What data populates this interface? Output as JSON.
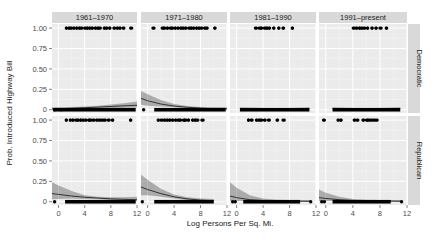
{
  "chart_data": {
    "type": "scatter",
    "subtype": "faceted logistic regression with binary points and confidence band",
    "xlabel": "Log Persons Per Sq. Mi.",
    "ylabel": "Prob. Introduced Highway Bill",
    "xlim": [
      -1,
      12
    ],
    "ylim": [
      0,
      1
    ],
    "x_ticks": [
      0,
      4,
      8,
      12
    ],
    "y_ticks": [
      0,
      0.25,
      0.5,
      0.75,
      1.0
    ],
    "y_tick_labels": [
      "0",
      "0.25",
      "0.50",
      "0.75",
      "1.00"
    ],
    "grid": true,
    "legend": "none",
    "facet_cols": [
      "1961–1970",
      "1971–1980",
      "1981–1990",
      "1991–present"
    ],
    "facet_rows": [
      "Democratic",
      "Republican"
    ],
    "panels": [
      {
        "row": "Democratic",
        "col": "1961–1970",
        "points_y1_x": [
          1.2,
          1.6,
          2.0,
          2.4,
          2.8,
          3.2,
          3.6,
          4.0,
          4.4,
          4.8,
          5.2,
          5.6,
          6.0,
          6.4,
          7.0,
          7.4,
          7.8,
          8.6,
          9.0,
          9.4,
          10.0,
          11.2
        ],
        "points_y0_range": [
          -0.8,
          11.8
        ],
        "points_y0_isolated": [
          -0.6,
          0.4
        ],
        "fit_x": [
          -1,
          0,
          2,
          4,
          6,
          8,
          10,
          12
        ],
        "fit_y": [
          0.01,
          0.012,
          0.018,
          0.025,
          0.032,
          0.04,
          0.048,
          0.055
        ],
        "ci_low": [
          0.0,
          0.0,
          0.005,
          0.012,
          0.018,
          0.022,
          0.025,
          0.028
        ],
        "ci_high": [
          0.03,
          0.03,
          0.035,
          0.04,
          0.05,
          0.065,
          0.08,
          0.1
        ]
      },
      {
        "row": "Democratic",
        "col": "1971–1980",
        "points_y1_x": [
          0.8,
          2.2,
          2.6,
          3.0,
          3.4,
          3.8,
          4.2,
          4.6,
          5.0,
          5.4,
          5.8,
          6.2,
          6.6,
          7.0,
          7.4,
          7.8,
          8.2,
          8.6,
          9.0,
          10.2
        ],
        "points_y0_range": [
          1.0,
          11.8
        ],
        "points_y0_isolated": [
          -0.6
        ],
        "fit_x": [
          -1,
          0,
          2,
          4,
          6,
          8,
          10,
          12
        ],
        "fit_y": [
          0.14,
          0.11,
          0.07,
          0.045,
          0.03,
          0.02,
          0.013,
          0.01
        ],
        "ci_low": [
          0.06,
          0.05,
          0.04,
          0.03,
          0.02,
          0.01,
          0.005,
          0.0
        ],
        "ci_high": [
          0.23,
          0.19,
          0.12,
          0.07,
          0.045,
          0.035,
          0.03,
          0.03
        ]
      },
      {
        "row": "Democratic",
        "col": "1981–1990",
        "points_y1_x": [
          3.0,
          3.4,
          3.8,
          4.2,
          4.6,
          5.0,
          5.6,
          6.4,
          7.0,
          8.4
        ],
        "points_y0_range": [
          0.5,
          11.0
        ],
        "points_y0_isolated": [],
        "fit_x": [
          0.5,
          4,
          8,
          11
        ],
        "fit_y": [
          0.012,
          0.012,
          0.012,
          0.012
        ],
        "ci_low": [
          0.0,
          0.005,
          0.005,
          0.0
        ],
        "ci_high": [
          0.03,
          0.02,
          0.02,
          0.03
        ]
      },
      {
        "row": "Democratic",
        "col": "1991–present",
        "points_y1_x": [
          4.2,
          4.6,
          5.0,
          5.4,
          5.8,
          6.2,
          6.8,
          7.4,
          8.0,
          9.0
        ],
        "points_y0_range": [
          1.0,
          11.0
        ],
        "points_y0_isolated": [],
        "fit_x": [
          1,
          4,
          8,
          11
        ],
        "fit_y": [
          0.014,
          0.014,
          0.014,
          0.014
        ],
        "ci_low": [
          0.0,
          0.006,
          0.006,
          0.0
        ],
        "ci_high": [
          0.03,
          0.022,
          0.022,
          0.03
        ]
      },
      {
        "row": "Republican",
        "col": "1961–1970",
        "points_y1_x": [
          1.2,
          1.8,
          2.2,
          2.6,
          3.0,
          3.4,
          3.8,
          4.2,
          4.6,
          5.0,
          5.4,
          5.8,
          6.2,
          6.6,
          7.0,
          7.6,
          8.2,
          11.0
        ],
        "points_y0_range": [
          1.0,
          11.8
        ],
        "points_y0_isolated": [
          -0.6
        ],
        "fit_x": [
          -1,
          0,
          2,
          4,
          6,
          8,
          10,
          12
        ],
        "fit_y": [
          0.1,
          0.09,
          0.07,
          0.055,
          0.045,
          0.035,
          0.03,
          0.025
        ],
        "ci_low": [
          0.03,
          0.035,
          0.04,
          0.035,
          0.03,
          0.02,
          0.01,
          0.005
        ],
        "ci_high": [
          0.24,
          0.2,
          0.13,
          0.08,
          0.06,
          0.055,
          0.055,
          0.06
        ]
      },
      {
        "row": "Republican",
        "col": "1971–1980",
        "points_y1_x": [
          1.6,
          2.2,
          2.6,
          3.0,
          3.4,
          3.8,
          4.2,
          4.6,
          5.0,
          5.4,
          5.8,
          6.2,
          6.8,
          7.2,
          7.6,
          8.2
        ],
        "points_y0_range": [
          1.0,
          10.0
        ],
        "points_y0_isolated": [
          -0.8
        ],
        "fit_x": [
          -1,
          0,
          2,
          4,
          6,
          8,
          10
        ],
        "fit_y": [
          0.18,
          0.15,
          0.1,
          0.06,
          0.035,
          0.02,
          0.012
        ],
        "ci_low": [
          0.08,
          0.08,
          0.06,
          0.04,
          0.02,
          0.008,
          0.0
        ],
        "ci_high": [
          0.33,
          0.27,
          0.16,
          0.09,
          0.055,
          0.04,
          0.035
        ]
      },
      {
        "row": "Republican",
        "col": "1981–1990",
        "points_y1_x": [
          1.8,
          2.2,
          3.0,
          3.4,
          3.8,
          4.2,
          4.8,
          6.2,
          7.2
        ],
        "points_y0_range": [
          1.0,
          9.6
        ],
        "points_y0_isolated": [
          -0.6,
          -0.2,
          11.2
        ],
        "fit_x": [
          -1,
          0,
          2,
          4,
          6,
          8,
          10,
          11.2
        ],
        "fit_y": [
          0.07,
          0.05,
          0.025,
          0.015,
          0.01,
          0.008,
          0.006,
          0.005
        ],
        "ci_low": [
          0.01,
          0.01,
          0.005,
          0.003,
          0.002,
          0.0,
          0.0,
          0.0
        ],
        "ci_high": [
          0.24,
          0.17,
          0.08,
          0.04,
          0.025,
          0.02,
          0.02,
          0.02
        ]
      },
      {
        "row": "Republican",
        "col": "1991–present",
        "points_y1_x": [
          -0.2,
          1.8,
          2.2,
          4.2,
          4.6,
          5.6,
          6.0,
          6.4,
          6.8,
          7.2,
          7.6
        ],
        "points_y0_range": [
          1.0,
          9.6
        ],
        "points_y0_isolated": [
          -0.6,
          -0.2,
          11.2
        ],
        "fit_x": [
          -1,
          0,
          2,
          4,
          6,
          8,
          10,
          11.2
        ],
        "fit_y": [
          0.05,
          0.04,
          0.025,
          0.016,
          0.012,
          0.009,
          0.007,
          0.006
        ],
        "ci_low": [
          0.01,
          0.01,
          0.008,
          0.005,
          0.003,
          0.0,
          0.0,
          0.0
        ],
        "ci_high": [
          0.15,
          0.11,
          0.06,
          0.035,
          0.025,
          0.02,
          0.02,
          0.02
        ]
      }
    ]
  },
  "colors": {
    "panel_bg": "#ebebeb",
    "strip_bg": "#d9d9d9",
    "grid_major": "#ffffff",
    "grid_minor": "#f5f5f5",
    "points": "#000000",
    "fit_line": "#333333",
    "ci_fill": "#333333",
    "tick_text": "#4d4d4d",
    "title_text": "#1a1a1a"
  }
}
